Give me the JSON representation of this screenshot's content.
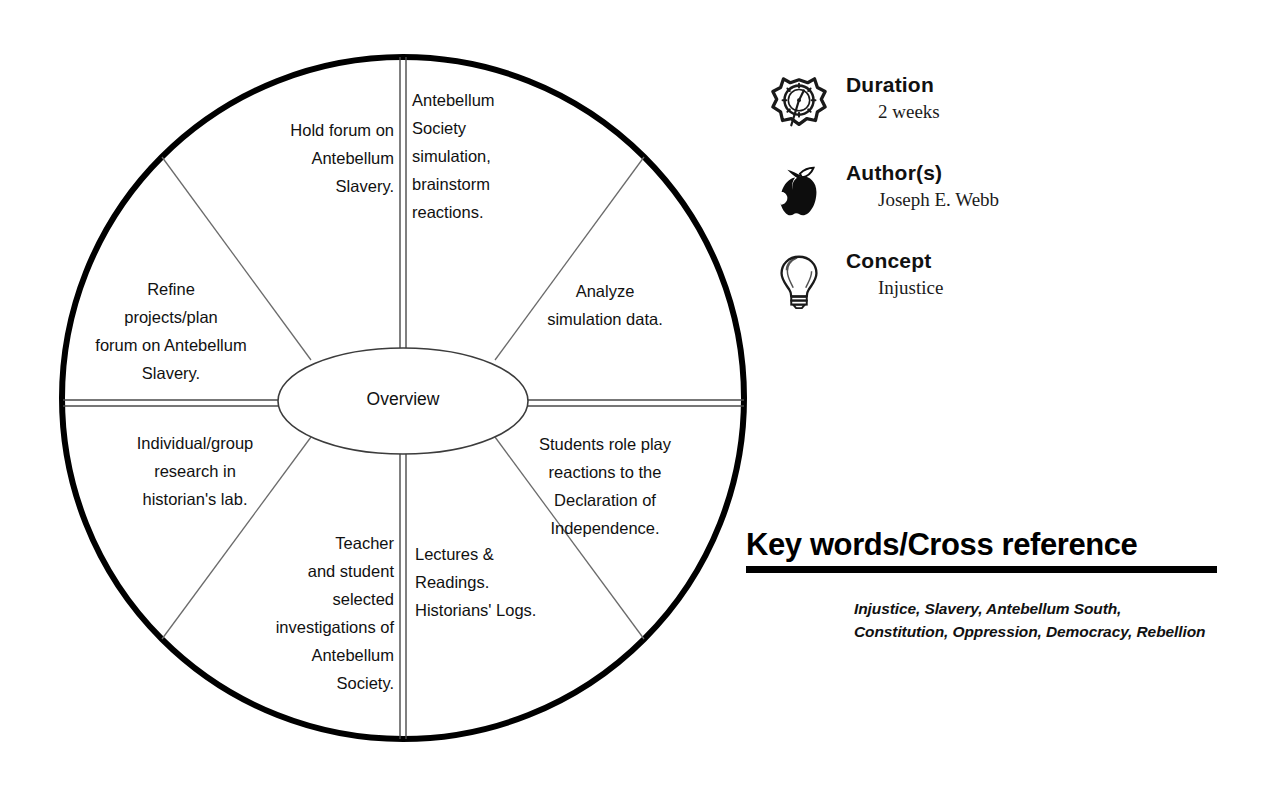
{
  "wheel": {
    "center_label": "Overview",
    "segments": [
      {
        "id": "antebellum-society-simulation",
        "text": "Antebellum\nSociety\nsimulation,\nbrainstorm\nreactions.",
        "align": "left"
      },
      {
        "id": "analyze-simulation-data",
        "text": "Analyze\nsimulation data.",
        "align": "center"
      },
      {
        "id": "students-role-play",
        "text": "Students role play\nreactions to the\nDeclaration of\nIndependence.",
        "align": "center"
      },
      {
        "id": "lectures-readings",
        "text": "Lectures &\nReadings.\nHistorians' Logs.",
        "align": "left"
      },
      {
        "id": "teacher-student-investigations",
        "text": "Teacher\nand student\nselected\ninvestigations of\nAntebellum\nSociety.",
        "align": "right"
      },
      {
        "id": "individual-group-research",
        "text": "Individual/group\nresearch in\nhistorian's lab.",
        "align": "center"
      },
      {
        "id": "refine-projects-plan-forum",
        "text": "Refine\nprojects/plan\nforum on Antebellum\nSlavery.",
        "align": "center"
      },
      {
        "id": "hold-forum-antebellum-slavery",
        "text": "Hold forum on\nAntebellum\nSlavery.",
        "align": "right"
      }
    ]
  },
  "meta": {
    "items": [
      {
        "icon": "clock-icon",
        "title": "Duration",
        "value": "2 weeks"
      },
      {
        "icon": "apple-icon",
        "title": "Author(s)",
        "value": "Joseph E. Webb"
      },
      {
        "icon": "lightbulb-icon",
        "title": "Concept",
        "value": "Injustice"
      }
    ]
  },
  "keywords": {
    "heading": "Key words/Cross reference",
    "text": "Injustice, Slavery, Antebellum South, Constitution, Oppression, Democracy, Rebellion"
  },
  "colors": {
    "ink": "#000000",
    "text": "#111111",
    "background": "#ffffff",
    "spoke": "#5a5a5a"
  }
}
